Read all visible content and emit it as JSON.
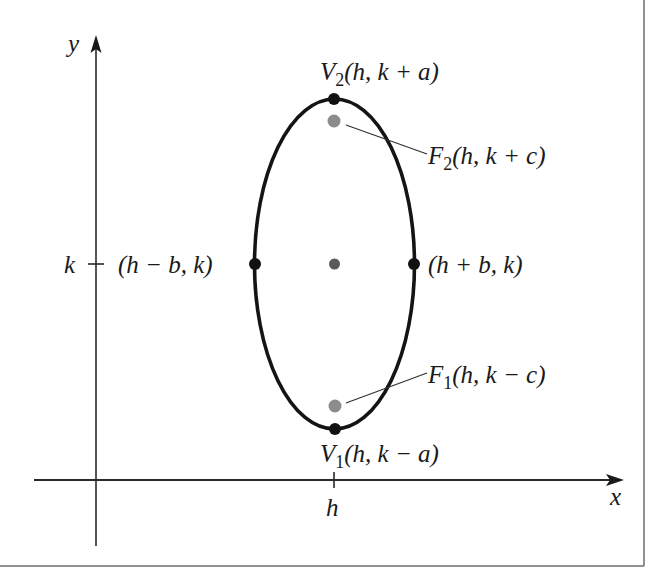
{
  "figure": {
    "colors": {
      "background": "#ffffff",
      "border": "#6e6e6e",
      "axis": "#2a2a2a",
      "ellipse": "#141414",
      "vertex_dot": "#111111",
      "focus_dot": "#8c8c8c",
      "center_dot": "#5a5a5a",
      "leader_line": "#333333"
    }
  },
  "axes": {
    "x_label": "x",
    "y_label": "y",
    "x_tick_label": "h",
    "y_tick_label": "k"
  },
  "points": {
    "v2": {
      "name": "V",
      "sub": "2",
      "coords": "(h, k + a)"
    },
    "f2": {
      "name": "F",
      "sub": "2",
      "coords": "(h, k + c)"
    },
    "left": {
      "coords": "(h − b, k)"
    },
    "right": {
      "coords": "(h + b, k)"
    },
    "f1": {
      "name": "F",
      "sub": "1",
      "coords": "(h, k − c)"
    },
    "v1": {
      "name": "V",
      "sub": "1",
      "coords": "(h, k − a)"
    }
  }
}
